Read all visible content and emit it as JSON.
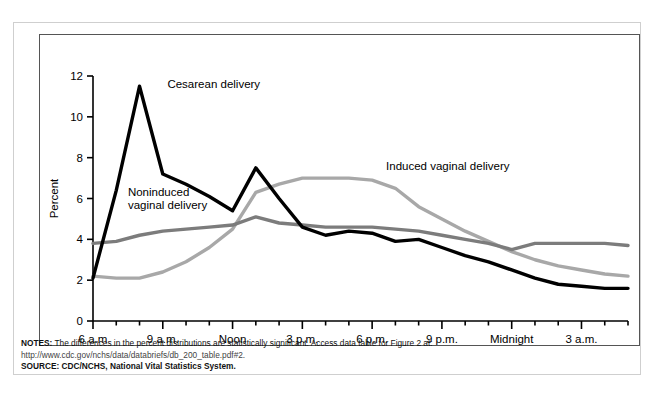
{
  "figure": {
    "notes_label": "NOTES:",
    "notes_text": " The differences in the percent distributions are statistically significant. Access data table for Figure 2 at:",
    "notes_url": "http://www.cdc.gov/nchs/data/databriefs/db_200_table.pdf#2.",
    "source_label": "SOURCE:",
    "source_text": " CDC/NCHS, National Vital Statistics System."
  },
  "chart_data": {
    "type": "line",
    "title": "",
    "xlabel": "Hour",
    "ylabel": "Percent",
    "ylim": [
      0,
      12
    ],
    "yticks": [
      0,
      2,
      4,
      6,
      8,
      10,
      12
    ],
    "ytick_labels": [
      "0",
      "2",
      "4",
      "6",
      "8",
      "10",
      "12"
    ],
    "grid": false,
    "legend": "inline-annotations",
    "x": [
      "6 a.m.",
      "7 a.m.",
      "8 a.m.",
      "9 a.m.",
      "10 a.m.",
      "11 a.m.",
      "Noon",
      "1 p.m.",
      "2 p.m.",
      "3 p.m.",
      "4 p.m.",
      "5 p.m.",
      "6 p.m.",
      "7 p.m.",
      "8 p.m.",
      "9 p.m.",
      "10 p.m.",
      "11 p.m.",
      "Midnight",
      "1 a.m.",
      "2 a.m.",
      "3 a.m.",
      "4 a.m.",
      "5 a.m."
    ],
    "xtick_major_labels": [
      "6 a.m",
      "9 a.m.",
      "Noon",
      "3 p.m.",
      "6 p.m.",
      "9 p.m.",
      "Midnight",
      "3 a.m."
    ],
    "xtick_major_indices": [
      0,
      3,
      6,
      9,
      12,
      15,
      18,
      21
    ],
    "series": [
      {
        "name": "Cesarean delivery",
        "color": "#000000",
        "label_x_index": 3.2,
        "label_y": 11.4,
        "values": [
          2.1,
          6.4,
          11.5,
          7.2,
          6.7,
          6.1,
          5.4,
          7.5,
          6.0,
          4.6,
          4.2,
          4.4,
          4.3,
          3.9,
          4.0,
          3.6,
          3.2,
          2.9,
          2.5,
          2.1,
          1.8,
          1.7,
          1.6,
          1.6
        ]
      },
      {
        "name": "Noninduced vaginal delivery",
        "color": "#7c7c7c",
        "label_x_index": 1.5,
        "label_y": 6.1,
        "values": [
          3.8,
          3.9,
          4.2,
          4.4,
          4.5,
          4.6,
          4.7,
          5.1,
          4.8,
          4.7,
          4.6,
          4.6,
          4.6,
          4.5,
          4.4,
          4.2,
          4.0,
          3.8,
          3.5,
          3.8,
          3.8,
          3.8,
          3.8,
          3.7
        ]
      },
      {
        "name": "Induced vaginal delivery",
        "color": "#a8a8a8",
        "label_x_index": 12.6,
        "label_y": 7.4,
        "values": [
          2.2,
          2.1,
          2.1,
          2.4,
          2.9,
          3.6,
          4.5,
          6.3,
          6.7,
          7.0,
          7.0,
          7.0,
          6.9,
          6.5,
          5.6,
          5.0,
          4.4,
          3.9,
          3.4,
          3.0,
          2.7,
          2.5,
          2.3,
          2.2
        ]
      }
    ]
  }
}
